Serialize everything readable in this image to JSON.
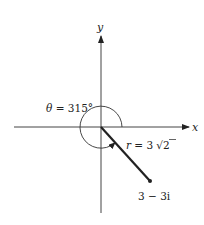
{
  "figure": {
    "type": "polar-form-complex-number",
    "axes": {
      "x_label": "x",
      "y_label": "y"
    },
    "angle": {
      "symbol": "θ",
      "equals": " = ",
      "value": "315°",
      "degrees": 315
    },
    "modulus": {
      "symbol": "r",
      "equals": " = ",
      "coefficient": "3",
      "radical": "√",
      "radicand": "2"
    },
    "point": {
      "label": "3 − 3i",
      "real": 3,
      "imag": -3
    },
    "colors": {
      "line": "#222222",
      "axis": "#444444",
      "background": "#ffffff"
    }
  }
}
